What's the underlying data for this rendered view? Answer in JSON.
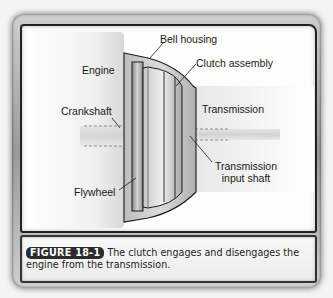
{
  "figure": {
    "number_badge": "FIGURE 18-1",
    "caption": "The clutch engages and disengages the engine from the transmission."
  },
  "diagram": {
    "labels": {
      "engine": "Engine",
      "bell_housing": "Bell housing",
      "clutch_assembly": "Clutch assembly",
      "crankshaft": "Crankshaft",
      "transmission": "Transmission",
      "transmission_input_shaft_line1": "Transmission",
      "transmission_input_shaft_line2": "input shaft",
      "flywheel": "Flywheel"
    },
    "colors": {
      "outline": "#1a1a1a",
      "metal_light": "#e6e6e6",
      "metal_mid": "#a8a8a8",
      "metal_dark": "#6e6e6e",
      "shaft": "#d0d0d0"
    }
  }
}
